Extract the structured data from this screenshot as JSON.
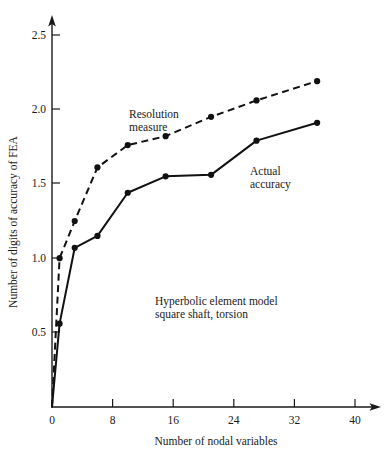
{
  "chart_data": {
    "type": "line",
    "title": "",
    "subtitle": "",
    "xlabel": "Number of nodal variables",
    "ylabel": "Number of digits of accuracy of FEA",
    "xlim": [
      0,
      41.5
    ],
    "ylim": [
      0,
      2.62
    ],
    "xticks": [
      0,
      8,
      16,
      24,
      32,
      40
    ],
    "xticklabels": [
      "0",
      "8",
      "16",
      "24",
      "32",
      "40"
    ],
    "yticks": [
      0.5,
      1.0,
      1.5,
      2.0,
      2.5
    ],
    "yticklabels": [
      "0.5",
      "1.0",
      "1.5",
      "2.0",
      "2.5"
    ],
    "origin_label": "0",
    "grid": false,
    "legend": "inline-annotations",
    "axis_arrows": true,
    "series": [
      {
        "name": "Resolution measure",
        "style": "dashed",
        "marker": "filled-circle",
        "color": "#111111",
        "x": [
          0,
          1,
          3,
          6,
          10,
          15,
          21,
          27,
          35
        ],
        "y": [
          0.0,
          1.0,
          1.25,
          1.61,
          1.76,
          1.82,
          1.95,
          2.06,
          2.19
        ]
      },
      {
        "name": "Actual accuracy",
        "style": "solid",
        "marker": "filled-circle",
        "color": "#111111",
        "x": [
          0,
          1,
          3,
          6,
          10,
          15,
          21,
          27,
          35
        ],
        "y": [
          0.0,
          0.56,
          1.07,
          1.15,
          1.44,
          1.55,
          1.56,
          1.79,
          1.91
        ]
      }
    ],
    "annotations": [
      {
        "name": "resolution-measure-label",
        "lines": [
          "Resolution",
          "measure"
        ],
        "x_px": 129,
        "y_px": 118
      },
      {
        "name": "actual-accuracy-label",
        "lines": [
          "Actual",
          "accuracy"
        ],
        "x_px": 250,
        "y_px": 175
      },
      {
        "name": "model-description-label",
        "lines": [
          "Hyperbolic element model",
          "square shaft, torsion"
        ],
        "x_px": 155,
        "y_px": 305
      }
    ]
  },
  "labels": {
    "ytick_2_5": "2.5",
    "ytick_2_0": "2.0",
    "ytick_1_5": "1.5",
    "ytick_1_0": "1.0",
    "ytick_0_5": "0.5",
    "xtick_0": "0",
    "xtick_8": "8",
    "xtick_16": "16",
    "xtick_24": "24",
    "xtick_32": "32",
    "xtick_40": "40",
    "x_axis_title": "Number of nodal variables",
    "y_axis_title": "Number of digits of accuracy of FEA",
    "annot_resolution_line1": "Resolution",
    "annot_resolution_line2": "measure",
    "annot_actual_line1": "Actual",
    "annot_actual_line2": "accuracy",
    "annot_model_line1": "Hyperbolic element model",
    "annot_model_line2": "square shaft, torsion"
  },
  "colors": {
    "ink": "#111111",
    "background": "#ffffff"
  }
}
